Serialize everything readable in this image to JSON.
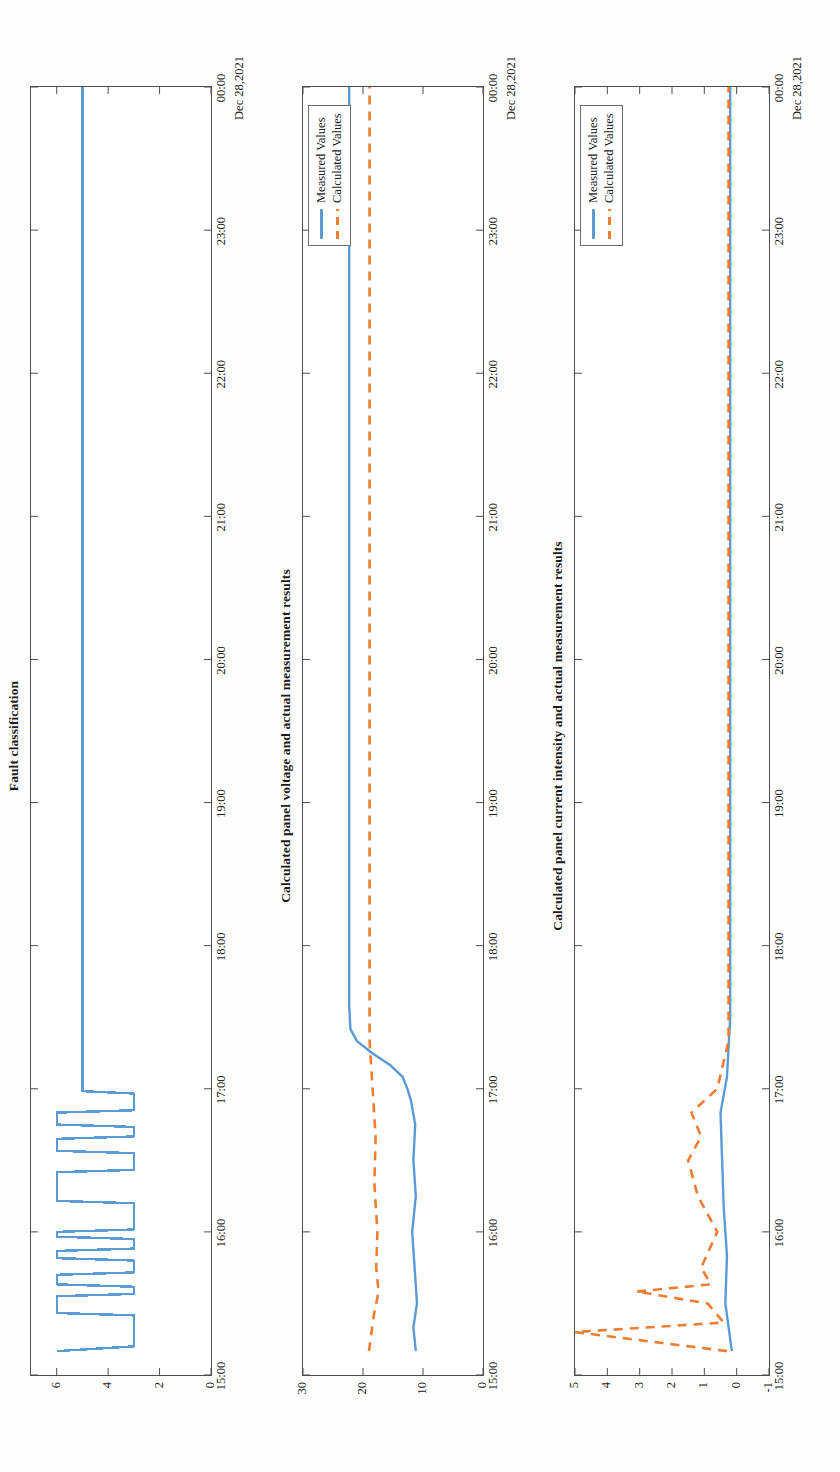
{
  "page": {
    "orientation": "rotated-90-ccw",
    "date_caption": "Dec 28,2021"
  },
  "colors": {
    "measured": "#5b9bd5",
    "calculated": "#ed7d31",
    "axis": "#4d4d4d",
    "text": "#1a1a1a"
  },
  "legend": {
    "measured_label": "Measured Values",
    "calculated_label": "Calculated Values"
  },
  "charts": [
    {
      "title": "Fault classification",
      "yticks": [
        "0",
        "2",
        "4",
        "6"
      ],
      "xticks": [
        "15:00",
        "16:00",
        "17:00",
        "18:00",
        "19:00",
        "20:00",
        "21:00",
        "22:00",
        "23:00",
        "00:00"
      ],
      "date": "Dec 28,2021",
      "has_legend": false
    },
    {
      "title": "Calculated panel voltage and actual measurement results",
      "yticks": [
        "0",
        "10",
        "20",
        "30"
      ],
      "xticks": [
        "15:00",
        "16:00",
        "17:00",
        "18:00",
        "19:00",
        "20:00",
        "21:00",
        "22:00",
        "23:00",
        "00:00"
      ],
      "date": "Dec 28,2021",
      "has_legend": true
    },
    {
      "title": "Calculated panel current intensity and actual measurement results",
      "yticks": [
        "-1",
        "0",
        "1",
        "2",
        "3",
        "4",
        "5"
      ],
      "xticks": [
        "15:00",
        "16:00",
        "17:00",
        "18:00",
        "19:00",
        "20:00",
        "21:00",
        "22:00",
        "23:00",
        "00:00"
      ],
      "date": "Dec 28,2021",
      "has_legend": true
    }
  ],
  "chart_data": [
    {
      "type": "line",
      "title": "Fault classification",
      "xlabel": "Dec 28,2021",
      "ylabel": "",
      "xlim": [
        "15:00",
        "00:00"
      ],
      "ylim": [
        0,
        7
      ],
      "grid": false,
      "legend": "none",
      "xticks": [
        "15:00",
        "16:00",
        "17:00",
        "18:00",
        "19:00",
        "20:00",
        "21:00",
        "22:00",
        "23:00",
        "00:00"
      ],
      "yticks": [
        0,
        2,
        4,
        6
      ],
      "series": [
        {
          "name": "Fault class",
          "color": "#5b9bd5",
          "style": "solid",
          "note": "Step signal switching between class 3 and class 6 during 15:10-16:55, then class 5 from 17:05 to 00:00",
          "points": [
            {
              "t": "15:10",
              "v": 6
            },
            {
              "t": "15:12",
              "v": 3
            },
            {
              "t": "15:25",
              "v": 3
            },
            {
              "t": "15:26",
              "v": 6
            },
            {
              "t": "15:33",
              "v": 6
            },
            {
              "t": "15:34",
              "v": 3
            },
            {
              "t": "15:37",
              "v": 3
            },
            {
              "t": "15:38",
              "v": 6
            },
            {
              "t": "15:42",
              "v": 6
            },
            {
              "t": "15:43",
              "v": 3
            },
            {
              "t": "15:48",
              "v": 3
            },
            {
              "t": "15:49",
              "v": 6
            },
            {
              "t": "15:52",
              "v": 6
            },
            {
              "t": "15:53",
              "v": 3
            },
            {
              "t": "15:57",
              "v": 3
            },
            {
              "t": "15:58",
              "v": 6
            },
            {
              "t": "16:00",
              "v": 6
            },
            {
              "t": "16:01",
              "v": 3
            },
            {
              "t": "16:12",
              "v": 3
            },
            {
              "t": "16:13",
              "v": 6
            },
            {
              "t": "16:25",
              "v": 6
            },
            {
              "t": "16:26",
              "v": 3
            },
            {
              "t": "16:33",
              "v": 3
            },
            {
              "t": "16:34",
              "v": 6
            },
            {
              "t": "16:39",
              "v": 6
            },
            {
              "t": "16:40",
              "v": 3
            },
            {
              "t": "16:44",
              "v": 3
            },
            {
              "t": "16:45",
              "v": 6
            },
            {
              "t": "16:50",
              "v": 6
            },
            {
              "t": "16:51",
              "v": 3
            },
            {
              "t": "16:58",
              "v": 3
            },
            {
              "t": "16:59",
              "v": 5
            },
            {
              "t": "17:05",
              "v": 5
            },
            {
              "t": "00:00",
              "v": 5
            }
          ]
        }
      ]
    },
    {
      "type": "line",
      "title": "Calculated panel voltage and actual measurement results",
      "xlabel": "Dec 28,2021",
      "ylabel": "",
      "xlim": [
        "15:00",
        "00:00"
      ],
      "ylim": [
        0,
        30
      ],
      "grid": false,
      "legend": "upper-right",
      "xticks": [
        "15:00",
        "16:00",
        "17:00",
        "18:00",
        "19:00",
        "20:00",
        "21:00",
        "22:00",
        "23:00",
        "00:00"
      ],
      "yticks": [
        0,
        10,
        20,
        30
      ],
      "series": [
        {
          "name": "Measured Values",
          "color": "#5b9bd5",
          "style": "solid",
          "points": [
            {
              "t": "15:10",
              "v": 11.2
            },
            {
              "t": "15:20",
              "v": 11.6
            },
            {
              "t": "15:30",
              "v": 11.0
            },
            {
              "t": "15:45",
              "v": 11.4
            },
            {
              "t": "16:00",
              "v": 11.8
            },
            {
              "t": "16:15",
              "v": 11.2
            },
            {
              "t": "16:30",
              "v": 11.6
            },
            {
              "t": "16:45",
              "v": 11.3
            },
            {
              "t": "16:55",
              "v": 12.0
            },
            {
              "t": "17:00",
              "v": 12.6
            },
            {
              "t": "17:05",
              "v": 13.4
            },
            {
              "t": "17:10",
              "v": 15.5
            },
            {
              "t": "17:15",
              "v": 18.5
            },
            {
              "t": "17:20",
              "v": 21.0
            },
            {
              "t": "17:25",
              "v": 22.1
            },
            {
              "t": "17:35",
              "v": 22.3
            },
            {
              "t": "18:00",
              "v": 22.3
            },
            {
              "t": "20:00",
              "v": 22.3
            },
            {
              "t": "22:00",
              "v": 22.3
            },
            {
              "t": "00:00",
              "v": 22.3
            }
          ]
        },
        {
          "name": "Calculated Values",
          "color": "#ed7d31",
          "style": "dashed",
          "points": [
            {
              "t": "15:10",
              "v": 19.0
            },
            {
              "t": "15:25",
              "v": 18.2
            },
            {
              "t": "15:35",
              "v": 17.4
            },
            {
              "t": "15:45",
              "v": 17.8
            },
            {
              "t": "16:00",
              "v": 17.6
            },
            {
              "t": "16:20",
              "v": 18.1
            },
            {
              "t": "16:40",
              "v": 17.9
            },
            {
              "t": "17:00",
              "v": 18.4
            },
            {
              "t": "17:20",
              "v": 18.9
            },
            {
              "t": "18:00",
              "v": 18.9
            },
            {
              "t": "20:00",
              "v": 18.9
            },
            {
              "t": "22:00",
              "v": 18.9
            },
            {
              "t": "00:00",
              "v": 18.9
            }
          ]
        }
      ]
    },
    {
      "type": "line",
      "title": "Calculated panel current intensity and actual measurement results",
      "xlabel": "Dec 28,2021",
      "ylabel": "",
      "xlim": [
        "15:00",
        "00:00"
      ],
      "ylim": [
        -1,
        5
      ],
      "grid": false,
      "legend": "upper-right",
      "xticks": [
        "15:00",
        "16:00",
        "17:00",
        "18:00",
        "19:00",
        "20:00",
        "21:00",
        "22:00",
        "23:00",
        "00:00"
      ],
      "yticks": [
        -1,
        0,
        1,
        2,
        3,
        4,
        5
      ],
      "series": [
        {
          "name": "Measured Values",
          "color": "#5b9bd5",
          "style": "solid",
          "points": [
            {
              "t": "15:10",
              "v": 0.15
            },
            {
              "t": "15:30",
              "v": 0.35
            },
            {
              "t": "15:50",
              "v": 0.3
            },
            {
              "t": "16:10",
              "v": 0.4
            },
            {
              "t": "16:30",
              "v": 0.45
            },
            {
              "t": "16:50",
              "v": 0.5
            },
            {
              "t": "17:05",
              "v": 0.3
            },
            {
              "t": "17:30",
              "v": 0.2
            },
            {
              "t": "18:00",
              "v": 0.2
            },
            {
              "t": "20:00",
              "v": 0.2
            },
            {
              "t": "22:00",
              "v": 0.2
            },
            {
              "t": "00:00",
              "v": 0.2
            }
          ]
        },
        {
          "name": "Calculated Values",
          "color": "#ed7d31",
          "style": "dashed",
          "points": [
            {
              "t": "15:10",
              "v": 0.3
            },
            {
              "t": "15:18",
              "v": 5.0
            },
            {
              "t": "15:22",
              "v": 0.4
            },
            {
              "t": "15:30",
              "v": 0.9
            },
            {
              "t": "15:35",
              "v": 3.1
            },
            {
              "t": "15:38",
              "v": 0.8
            },
            {
              "t": "15:45",
              "v": 1.1
            },
            {
              "t": "16:00",
              "v": 0.6
            },
            {
              "t": "16:15",
              "v": 1.2
            },
            {
              "t": "16:30",
              "v": 1.5
            },
            {
              "t": "16:40",
              "v": 1.1
            },
            {
              "t": "16:50",
              "v": 1.4
            },
            {
              "t": "17:00",
              "v": 0.6
            },
            {
              "t": "17:20",
              "v": 0.25
            },
            {
              "t": "18:00",
              "v": 0.25
            },
            {
              "t": "20:00",
              "v": 0.25
            },
            {
              "t": "22:00",
              "v": 0.25
            },
            {
              "t": "00:00",
              "v": 0.25
            }
          ]
        }
      ]
    }
  ]
}
